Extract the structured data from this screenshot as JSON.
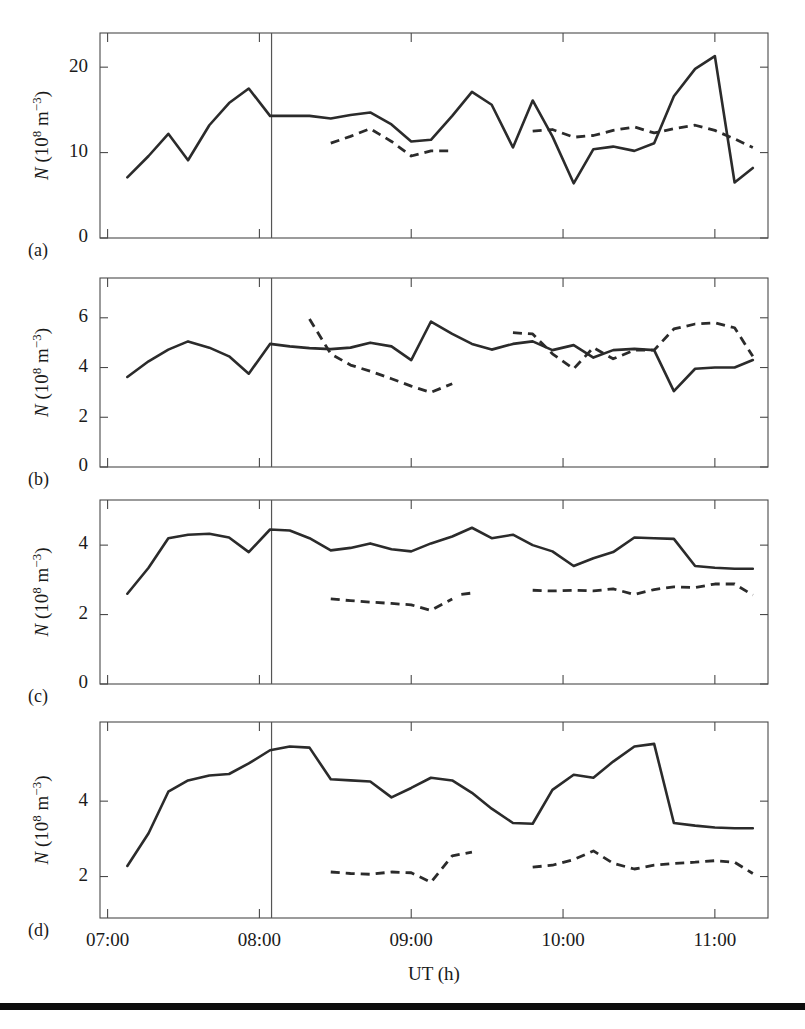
{
  "figure": {
    "bottom_rule_y": 1003,
    "panel_tags": [
      "(a)",
      "(b)",
      "(c)",
      "(d)"
    ],
    "xlabel": "UT (h)",
    "xtick_labels": [
      "07:00",
      "08:00",
      "09:00",
      "10:00",
      "11:00"
    ],
    "xtick_values": [
      7,
      8,
      9,
      10,
      11
    ],
    "ylabel_parts": {
      "n": "N",
      "open": " (10",
      "exp1": "8",
      "unit": " m",
      "exp2": "−3",
      "close": ")"
    },
    "ylabel_plain": "N (10^8 m^-3)",
    "marker_line_label": "08:05"
  },
  "chart_data": [
    {
      "type": "line",
      "panel": "(a)",
      "title": "",
      "xlabel": "UT (h)",
      "ylabel": "N (10^8 m^-3)",
      "xlim": [
        6.95,
        11.35
      ],
      "ylim": [
        0,
        24
      ],
      "yticks": [
        0,
        10,
        20
      ],
      "ytick_labels": [
        "0",
        "10",
        "20"
      ],
      "xticks": [
        7,
        8,
        9,
        10,
        11
      ],
      "grid": false,
      "legend": "none",
      "annotations": [
        {
          "type": "vline",
          "x": 8.08,
          "label": "event onset"
        }
      ],
      "series": [
        {
          "name": "solid",
          "style": "solid",
          "x": [
            7.13,
            7.27,
            7.4,
            7.53,
            7.67,
            7.8,
            7.93,
            8.07,
            8.2,
            8.33,
            8.47,
            8.6,
            8.73,
            8.87,
            9.0,
            9.13,
            9.27,
            9.4,
            9.53,
            9.67,
            9.8,
            9.93,
            10.07,
            10.2,
            10.33,
            10.47,
            10.6,
            10.73,
            10.87,
            11.0,
            11.13,
            11.25
          ],
          "values": [
            7.1,
            9.6,
            12.2,
            9.1,
            13.2,
            15.8,
            17.5,
            14.3,
            14.3,
            14.3,
            14.0,
            14.4,
            14.7,
            13.3,
            11.3,
            11.5,
            14.3,
            17.1,
            15.6,
            10.6,
            16.1,
            11.9,
            6.4,
            10.4,
            10.7,
            10.2,
            11.1,
            16.6,
            19.8,
            21.3,
            6.5,
            8.2
          ]
        },
        {
          "name": "dashed",
          "style": "dashed",
          "segments": [
            {
              "x": [
                8.47,
                8.6,
                8.73,
                8.87,
                9.0,
                9.13,
                9.27
              ],
              "values": [
                11.1,
                11.9,
                12.8,
                11.3,
                9.6,
                10.2,
                10.2
              ]
            },
            {
              "x": [
                9.8,
                9.93,
                10.07,
                10.2,
                10.33,
                10.47,
                10.6,
                10.73,
                10.87,
                11.0,
                11.13,
                11.25
              ],
              "values": [
                12.5,
                12.7,
                11.8,
                12.0,
                12.6,
                13.0,
                12.3,
                12.8,
                13.2,
                12.6,
                11.6,
                10.6
              ]
            }
          ]
        }
      ]
    },
    {
      "type": "line",
      "panel": "(b)",
      "title": "",
      "xlabel": "UT (h)",
      "ylabel": "N (10^8 m^-3)",
      "xlim": [
        6.95,
        11.35
      ],
      "ylim": [
        0,
        7.6
      ],
      "yticks": [
        0,
        2,
        4,
        6
      ],
      "ytick_labels": [
        "0",
        "2",
        "4",
        "6"
      ],
      "xticks": [
        7,
        8,
        9,
        10,
        11
      ],
      "grid": false,
      "legend": "none",
      "annotations": [
        {
          "type": "vline",
          "x": 8.08,
          "label": "event onset"
        }
      ],
      "series": [
        {
          "name": "solid",
          "style": "solid",
          "x": [
            7.13,
            7.27,
            7.4,
            7.53,
            7.67,
            7.8,
            7.93,
            8.07,
            8.2,
            8.33,
            8.47,
            8.6,
            8.73,
            8.87,
            9.0,
            9.13,
            9.27,
            9.4,
            9.53,
            9.67,
            9.8,
            9.93,
            10.07,
            10.2,
            10.33,
            10.47,
            10.6,
            10.73,
            10.87,
            11.0,
            11.13,
            11.25
          ],
          "values": [
            3.62,
            4.25,
            4.72,
            5.05,
            4.8,
            4.45,
            3.75,
            4.95,
            4.85,
            4.78,
            4.74,
            4.8,
            5.0,
            4.85,
            4.3,
            5.85,
            5.35,
            4.95,
            4.72,
            4.95,
            5.05,
            4.7,
            4.9,
            4.4,
            4.7,
            4.75,
            4.7,
            3.05,
            3.95,
            4.0,
            4.0,
            4.3
          ]
        },
        {
          "name": "dashed",
          "style": "dashed",
          "segments": [
            {
              "x": [
                8.33,
                8.47,
                8.6,
                8.73,
                8.87,
                9.0,
                9.13,
                9.27
              ],
              "values": [
                5.95,
                4.55,
                4.1,
                3.85,
                3.55,
                3.25,
                3.0,
                3.35
              ]
            },
            {
              "x": [
                9.67,
                9.8,
                9.93,
                10.07,
                10.2,
                10.33,
                10.47,
                10.6,
                10.73,
                10.87,
                11.0,
                11.13,
                11.25
              ],
              "values": [
                5.4,
                5.35,
                4.55,
                3.95,
                4.8,
                4.35,
                4.7,
                4.7,
                5.55,
                5.75,
                5.8,
                5.6,
                4.45
              ]
            }
          ]
        }
      ]
    },
    {
      "type": "line",
      "panel": "(c)",
      "title": "",
      "xlabel": "UT (h)",
      "ylabel": "N (10^8 m^-3)",
      "xlim": [
        6.95,
        11.35
      ],
      "ylim": [
        0,
        5.3
      ],
      "yticks": [
        0,
        2,
        4
      ],
      "ytick_labels": [
        "0",
        "2",
        "4"
      ],
      "xticks": [
        7,
        8,
        9,
        10,
        11
      ],
      "grid": false,
      "legend": "none",
      "annotations": [
        {
          "type": "vline",
          "x": 8.08,
          "label": "event onset"
        }
      ],
      "series": [
        {
          "name": "solid",
          "style": "solid",
          "x": [
            7.13,
            7.27,
            7.4,
            7.53,
            7.67,
            7.8,
            7.93,
            8.07,
            8.2,
            8.33,
            8.47,
            8.6,
            8.73,
            8.87,
            9.0,
            9.13,
            9.27,
            9.4,
            9.53,
            9.67,
            9.8,
            9.93,
            10.07,
            10.2,
            10.33,
            10.47,
            10.6,
            10.73,
            10.87,
            11.0,
            11.13,
            11.25
          ],
          "values": [
            2.6,
            3.35,
            4.2,
            4.3,
            4.33,
            4.22,
            3.8,
            4.45,
            4.42,
            4.2,
            3.85,
            3.92,
            4.05,
            3.88,
            3.82,
            4.05,
            4.25,
            4.5,
            4.2,
            4.3,
            4.0,
            3.82,
            3.4,
            3.62,
            3.8,
            4.22,
            4.2,
            4.18,
            3.4,
            3.35,
            3.32,
            3.32
          ]
        },
        {
          "name": "dashed",
          "style": "dashed",
          "segments": [
            {
              "x": [
                8.47,
                8.6,
                8.73,
                8.87,
                9.0,
                9.13,
                9.27
              ],
              "values": [
                2.45,
                2.4,
                2.36,
                2.32,
                2.28,
                2.12,
                2.45
              ]
            },
            {
              "x": [
                9.33,
                9.4
              ],
              "values": [
                2.58,
                2.62
              ]
            },
            {
              "x": [
                9.8,
                9.93,
                10.07,
                10.2,
                10.33,
                10.47,
                10.6,
                10.73,
                10.87,
                11.0,
                11.13,
                11.25
              ],
              "values": [
                2.7,
                2.68,
                2.7,
                2.68,
                2.74,
                2.58,
                2.72,
                2.8,
                2.78,
                2.88,
                2.88,
                2.56
              ]
            }
          ]
        }
      ]
    },
    {
      "type": "line",
      "panel": "(d)",
      "title": "",
      "xlabel": "UT (h)",
      "ylabel": "N (10^8 m^-3)",
      "xlim": [
        6.95,
        11.35
      ],
      "ylim": [
        0.9,
        6.1
      ],
      "yticks": [
        2,
        4
      ],
      "ytick_labels": [
        "2",
        "4"
      ],
      "xticks": [
        7,
        8,
        9,
        10,
        11
      ],
      "grid": false,
      "legend": "none",
      "annotations": [
        {
          "type": "vline",
          "x": 8.08,
          "label": "event onset"
        }
      ],
      "series": [
        {
          "name": "solid",
          "style": "solid",
          "x": [
            7.13,
            7.27,
            7.4,
            7.53,
            7.67,
            7.8,
            7.93,
            8.07,
            8.2,
            8.33,
            8.47,
            8.6,
            8.73,
            8.87,
            9.0,
            9.13,
            9.27,
            9.4,
            9.53,
            9.67,
            9.8,
            9.93,
            10.07,
            10.2,
            10.33,
            10.47,
            10.6,
            10.73,
            10.87,
            11.0,
            11.13,
            11.25
          ],
          "values": [
            2.28,
            3.15,
            4.25,
            4.55,
            4.68,
            4.72,
            5.0,
            5.35,
            5.45,
            5.42,
            4.58,
            4.55,
            4.52,
            4.1,
            4.35,
            4.62,
            4.55,
            4.22,
            3.8,
            3.42,
            3.4,
            4.3,
            4.7,
            4.62,
            5.05,
            5.45,
            5.52,
            3.42,
            3.35,
            3.3,
            3.28,
            3.28
          ]
        },
        {
          "name": "dashed",
          "style": "dashed",
          "segments": [
            {
              "x": [
                8.47,
                8.6,
                8.73,
                8.87,
                9.0,
                9.13,
                9.27,
                9.4
              ],
              "values": [
                2.12,
                2.08,
                2.06,
                2.12,
                2.1,
                1.85,
                2.55,
                2.65
              ]
            },
            {
              "x": [
                9.8,
                9.93,
                10.07,
                10.2,
                10.33,
                10.47,
                10.6,
                10.73,
                10.87,
                11.0,
                11.13,
                11.25
              ],
              "values": [
                2.25,
                2.3,
                2.45,
                2.68,
                2.35,
                2.2,
                2.3,
                2.35,
                2.38,
                2.42,
                2.38,
                2.08
              ]
            }
          ]
        }
      ]
    }
  ]
}
